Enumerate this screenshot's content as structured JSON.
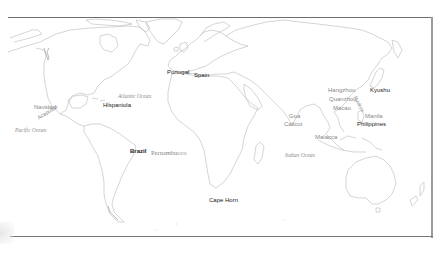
{
  "map": {
    "title": "",
    "places": [
      {
        "id": "portugal",
        "label": "Portugal",
        "x": 167,
        "y": 71,
        "style": "dark"
      },
      {
        "id": "spain",
        "label": "Spain",
        "x": 193,
        "y": 73,
        "style": "dark"
      },
      {
        "id": "hispaniola",
        "label": "Hispaniola",
        "x": 103,
        "y": 103,
        "style": "dark"
      },
      {
        "id": "navidad",
        "label": "Navidad",
        "x": 34,
        "y": 104,
        "style": "dim"
      },
      {
        "id": "acapulco",
        "label": "Acapulco",
        "x": 38,
        "y": 117,
        "style": "dim",
        "rotate": -32
      },
      {
        "id": "brazil",
        "label": "Brazil",
        "x": 130,
        "y": 149,
        "style": "dark"
      },
      {
        "id": "pernambucco",
        "label": "Pernambucco",
        "x": 150,
        "y": 151,
        "style": "dim"
      },
      {
        "id": "cape-horn",
        "label": "Cape Horn",
        "x": 209,
        "y": 198,
        "style": "dark"
      },
      {
        "id": "hangzhou",
        "label": "Hangzhou",
        "x": 328,
        "y": 88,
        "style": "dim"
      },
      {
        "id": "quanzhou",
        "label": "Quanzhou",
        "x": 329,
        "y": 97,
        "style": "dim"
      },
      {
        "id": "macao",
        "label": "Macao",
        "x": 333,
        "y": 106,
        "style": "dim"
      },
      {
        "id": "kyushu",
        "label": "Kyushu",
        "x": 369,
        "y": 88,
        "style": "dark"
      },
      {
        "id": "ryukyu",
        "label": "Ryukyu",
        "x": 354,
        "y": 98,
        "style": "dim",
        "rotate": 62
      },
      {
        "id": "manila",
        "label": "Manila",
        "x": 365,
        "y": 114,
        "style": "dim"
      },
      {
        "id": "philippines",
        "label": "Philippines",
        "x": 358,
        "y": 122,
        "style": "dark"
      },
      {
        "id": "goa",
        "label": "Goa",
        "x": 289,
        "y": 114,
        "style": "dim"
      },
      {
        "id": "calicut",
        "label": "Calicut",
        "x": 284,
        "y": 122,
        "style": "dim"
      },
      {
        "id": "malacca",
        "label": "Malacca",
        "x": 315,
        "y": 135,
        "style": "dim"
      }
    ],
    "oceans": [
      {
        "id": "atlantic-ocean",
        "label": "Atlantic Ocean",
        "x": 118,
        "y": 95
      },
      {
        "id": "pacific-ocean",
        "label": "Pacific Ocean",
        "x": 15,
        "y": 128
      },
      {
        "id": "indian-ocean",
        "label": "Indian Ocean",
        "x": 285,
        "y": 154
      }
    ]
  }
}
